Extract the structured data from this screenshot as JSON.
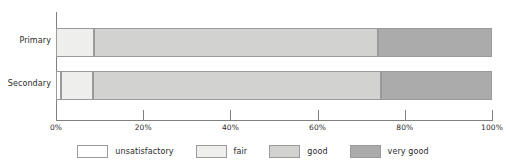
{
  "chart_data": {
    "type": "bar",
    "orientation": "horizontal",
    "stacked": true,
    "normalized": true,
    "title": "",
    "subtitle": "",
    "xlabel": "",
    "ylabel": "",
    "grid": false,
    "legend_position": "bottom",
    "categories": [
      "Primary",
      "Secondary"
    ],
    "xlim": [
      0,
      100
    ],
    "xticks": [
      0,
      20,
      40,
      60,
      80,
      100
    ],
    "xtick_labels": [
      "0%",
      "20%",
      "40%",
      "60%",
      "80%",
      "100%"
    ],
    "series": [
      {
        "name": "unsatisfactory",
        "color": "#ffffff",
        "values": [
          0.0,
          1.2
        ]
      },
      {
        "name": "fair",
        "color": "#eeeeec",
        "values": [
          8.7,
          7.3
        ]
      },
      {
        "name": "good",
        "color": "#d2d2d0",
        "values": [
          65.1,
          66.0
        ]
      },
      {
        "name": "very good",
        "color": "#ababab",
        "values": [
          26.2,
          25.5
        ]
      }
    ]
  },
  "legend": {
    "items": [
      {
        "label": "unsatisfactory",
        "color": "#ffffff"
      },
      {
        "label": "fair",
        "color": "#eeeeec"
      },
      {
        "label": "good",
        "color": "#d2d2d0"
      },
      {
        "label": "very good",
        "color": "#ababab"
      }
    ]
  },
  "axis": {
    "tick_labels": [
      "0%",
      "20%",
      "40%",
      "60%",
      "80%",
      "100%"
    ]
  },
  "categories": {
    "primary": "Primary",
    "secondary": "Secondary"
  },
  "colors": {
    "axis": "#808080",
    "segment_border": "#9a9a9a",
    "text": "#2b2b2b"
  }
}
